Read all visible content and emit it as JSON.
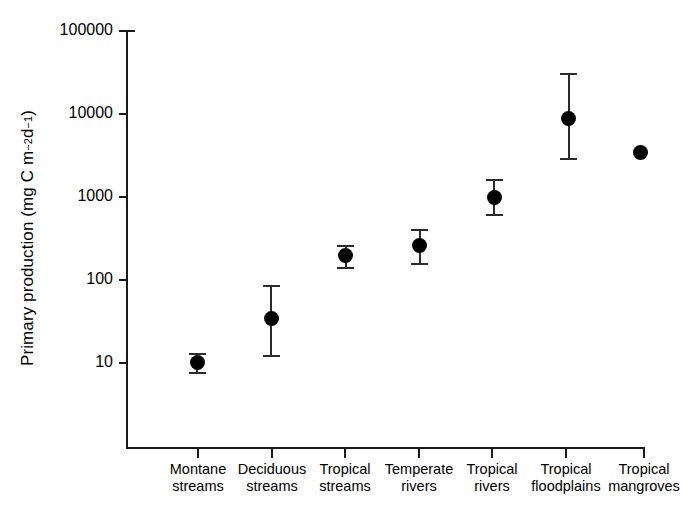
{
  "chart_data": {
    "type": "scatter",
    "title": "",
    "xlabel": "",
    "ylabel": "Primary production (mg C m−2 d−1)",
    "ylabel_parts": {
      "prefix": "Primary production (mg C m",
      "exp1": "−2",
      "mid": " d",
      "exp2": "−1",
      "suffix": ")"
    },
    "yscale": "log",
    "ylim": [
      1,
      100000
    ],
    "ytick_labels": [
      "100000",
      "10000",
      "1000",
      "100",
      "10"
    ],
    "ytick_values": [
      100000,
      10000,
      1000,
      100,
      10
    ],
    "grid": false,
    "legend": "none",
    "categories": [
      "Montane streams",
      "Deciduous streams",
      "Tropical streams",
      "Temperate rivers",
      "Tropical rivers",
      "Tropical floodplains",
      "Tropical mangroves"
    ],
    "category_lines": [
      [
        "Montane",
        "streams"
      ],
      [
        "Deciduous",
        "streams"
      ],
      [
        "Tropical",
        "streams"
      ],
      [
        "Temperate",
        "rivers"
      ],
      [
        "Tropical",
        "rivers"
      ],
      [
        "Tropical",
        "floodplains"
      ],
      [
        "Tropical",
        "mangroves"
      ]
    ],
    "values": [
      10,
      33,
      190,
      250,
      950,
      8500,
      3300
    ],
    "err_low": [
      7.5,
      12,
      140,
      155,
      600,
      2900,
      null
    ],
    "err_high": [
      13,
      85,
      260,
      400,
      1600,
      30000,
      null
    ],
    "marker": "filled-circle",
    "marker_color": "#000000",
    "axis_color": "#1a1a1a"
  }
}
